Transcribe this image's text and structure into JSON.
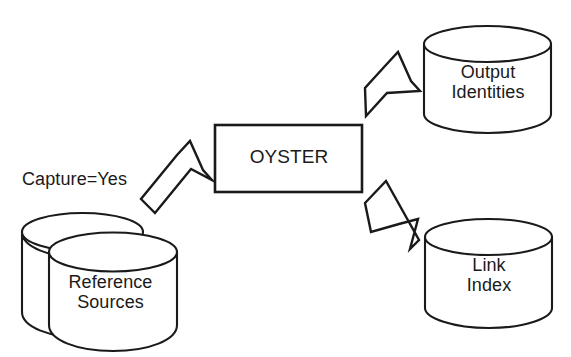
{
  "diagram": {
    "background_color": "#ffffff",
    "line_color": "#1a1a1a",
    "nodes": {
      "reference_sources": {
        "label": "Reference\nSources",
        "shape": "stacked-cylinder",
        "role": "input-datastore"
      },
      "oyster": {
        "label": "OYSTER",
        "shape": "rectangle",
        "role": "process"
      },
      "output_identities": {
        "label": "Output\nIdentities",
        "shape": "cylinder",
        "role": "output-datastore"
      },
      "link_index": {
        "label": "Link\nIndex",
        "shape": "cylinder",
        "role": "output-datastore"
      }
    },
    "annotations": {
      "capture_flag": "Capture=Yes"
    },
    "edges": [
      {
        "name": "input-flow",
        "from": "reference_sources",
        "to": "oyster",
        "style": "block-arrow",
        "direction": "up-right"
      },
      {
        "name": "output-identities-flow",
        "from": "oyster",
        "to": "output_identities",
        "style": "block-arrow",
        "direction": "up-right"
      },
      {
        "name": "link-index-flow",
        "from": "oyster",
        "to": "link_index",
        "style": "block-arrow",
        "direction": "down-right"
      }
    ]
  }
}
